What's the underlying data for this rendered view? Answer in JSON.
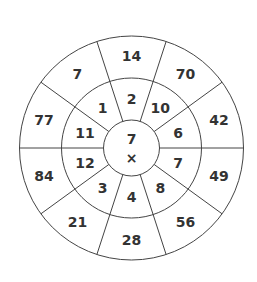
{
  "diagram": {
    "center": {
      "number": "7",
      "operator": "×"
    },
    "inner_ring": [
      "2",
      "10",
      "6",
      "7",
      "8",
      "4",
      "3",
      "12",
      "11",
      "1"
    ],
    "outer_ring": [
      "14",
      "70",
      "42",
      "49",
      "56",
      "28",
      "21",
      "84",
      "77",
      "7"
    ],
    "sectors": 10,
    "colors": {
      "line": "#444444",
      "text": "#333333",
      "background": "#ffffff"
    }
  }
}
